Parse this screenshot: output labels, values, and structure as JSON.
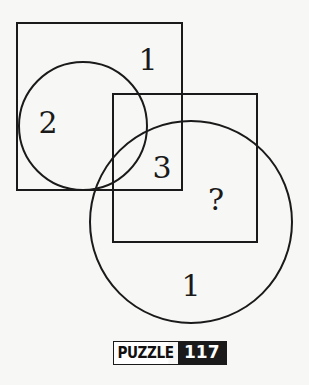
{
  "diagram": {
    "shapes": {
      "square_top_left": {
        "x": 17,
        "y": 23,
        "w": 165,
        "h": 167
      },
      "square_bottom_right": {
        "x": 113,
        "y": 94,
        "w": 144,
        "h": 148
      },
      "circle_small": {
        "cx": 83,
        "cy": 126,
        "r": 64
      },
      "circle_large": {
        "cx": 191,
        "cy": 222,
        "r": 101
      }
    },
    "labels": [
      {
        "id": "top-square-only",
        "text": "1",
        "x": 148,
        "y": 70
      },
      {
        "id": "small-circle-in-square",
        "text": "2",
        "x": 48,
        "y": 133
      },
      {
        "id": "squares-overlap-in-large-circle",
        "text": "3",
        "x": 162,
        "y": 178
      },
      {
        "id": "unknown-region",
        "text": "?",
        "x": 216,
        "y": 210
      },
      {
        "id": "large-circle-only",
        "text": "1",
        "x": 191,
        "y": 296
      }
    ],
    "stroke_color": "#1a1a1a"
  },
  "badge": {
    "label": "PUZZLE",
    "number": "117"
  }
}
